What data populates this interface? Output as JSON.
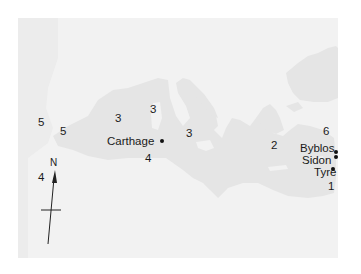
{
  "map": {
    "title": "Mediterranean Sea",
    "colors": {
      "land": "#f2f2f2",
      "sea": "#e5e5e5",
      "text": "#1a1a1a",
      "frame": "#ffffff"
    },
    "compass": {
      "label": "N"
    },
    "cities": [
      {
        "name": "Carthage",
        "x": 117,
        "y": 141,
        "dot_x": 162,
        "dot_y": 140
      },
      {
        "name": "Byblos",
        "x": 300,
        "y": 138,
        "dot_x": 335,
        "dot_y": 151
      },
      {
        "name": "Sidon",
        "x": 302,
        "y": 152,
        "dot_x": 335,
        "dot_y": 156
      },
      {
        "name": "Tyre",
        "x": 313,
        "y": 163,
        "dot_x": 332,
        "dot_y": 167
      }
    ],
    "numbers": [
      {
        "value": "5",
        "x": 38,
        "y": 117
      },
      {
        "value": "5",
        "x": 60,
        "y": 126
      },
      {
        "value": "4",
        "x": 38,
        "y": 172
      },
      {
        "value": "3",
        "x": 115,
        "y": 113
      },
      {
        "value": "3",
        "x": 150,
        "y": 104
      },
      {
        "value": "3",
        "x": 186,
        "y": 128
      },
      {
        "value": "4",
        "x": 145,
        "y": 153
      },
      {
        "value": "2",
        "x": 271,
        "y": 140
      },
      {
        "value": "6",
        "x": 323,
        "y": 126
      },
      {
        "value": "1",
        "x": 328,
        "y": 181
      }
    ]
  }
}
